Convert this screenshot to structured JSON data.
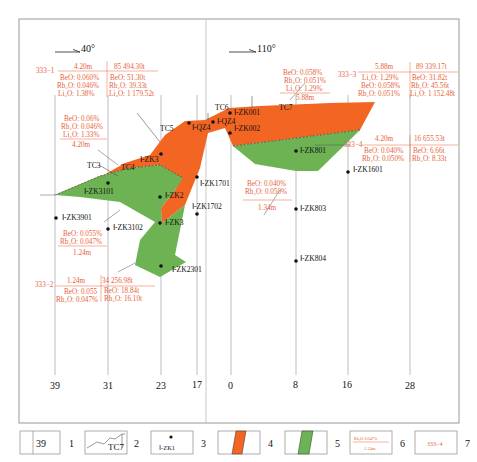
{
  "colors": {
    "orange_ore": "#f26522",
    "green_ore": "#6db253",
    "annotation": "#e8623a",
    "lines": "#aaaaaa",
    "text": "#111111"
  },
  "directions": {
    "left": "40°",
    "right": "110°"
  },
  "exploration_lines": [
    "39",
    "31",
    "23",
    "17",
    "0",
    "8",
    "16",
    "28"
  ],
  "trenches": [
    "TC3",
    "TC4",
    "TC5",
    "TC6",
    "TC7"
  ],
  "drillholes": [
    "Ⅰ-ZK001",
    "Ⅰ-QZ4",
    "Ⅰ-QZ4",
    "Ⅰ-ZK002",
    "Ⅰ-ZK3",
    "Ⅰ-ZK3101",
    "Ⅰ-ZK2",
    "Ⅰ-ZK1701",
    "Ⅰ-ZK1702",
    "Ⅰ-ZK3",
    "Ⅰ-ZK3901",
    "Ⅰ-ZK3102",
    "Ⅰ-ZK2301",
    "Ⅰ-ZK801",
    "Ⅰ-ZK1601",
    "Ⅰ-ZK803",
    "Ⅰ-ZK804"
  ],
  "blocks": {
    "b333_1": {
      "id": "333−1",
      "thickness": "4.20m",
      "tonnage": "85 494.30t",
      "grades": [
        "BeO: 0.060%",
        "Rb₂O: 0.046%",
        "Li₂O: 1.38%"
      ],
      "resources": [
        "BeO: 51.30t",
        "Rb₂O: 39.33t",
        "Li₂O: 1 179.52t"
      ]
    },
    "b333_2": {
      "id": "333−2",
      "thickness": "1.24m",
      "tonnage": "34 256.98t",
      "grades": [
        "BeO: 0.055",
        "Rb₂O: 0.047%"
      ],
      "resources": [
        "BeO: 18.84t",
        "Rb₂O: 16.10t"
      ]
    },
    "b333_3": {
      "id": "333−3",
      "thickness": "5.88m",
      "tonnage": "89 339.17t",
      "grades": [
        "Li₂O: 1.29%",
        "BeO: 0.058%",
        "Rb₂O: 0.051%"
      ],
      "resources": [
        "BeO: 31.82t",
        "Rb₂O: 45.56t",
        "Li₂O: 1 152.48t"
      ]
    },
    "b333_4": {
      "id": "333−4",
      "thickness": "4.20m",
      "tonnage": "16 655.53t",
      "grades": [
        "BeO: 0.040%",
        "Rb₂O: 0.050%"
      ],
      "resources": [
        "BeO: 6.66t",
        "Rb₂O: 8.33t"
      ]
    }
  },
  "body_annotations": {
    "orange_left": {
      "lines": [
        "BeO: 0.06%",
        "Rb₂O: 0.046%",
        "Li₂O: 1.33%"
      ],
      "thickness": "4.20m"
    },
    "orange_right": {
      "lines": [
        "BeO: 0.058%",
        "Rb₂O: 0.051%",
        "Li₂O: 1.29%"
      ],
      "thickness": "5.88m"
    },
    "green_left": {
      "lines": [
        "BeO: 0.055%",
        "Rb₂O: 0.047%"
      ],
      "thickness": "1.24m"
    },
    "green_right": {
      "lines": [
        "BeO: 0.040%",
        "Rb₂O: 0.050%"
      ],
      "thickness": "1.34m"
    }
  },
  "legend": [
    {
      "num": "1",
      "sample": "39"
    },
    {
      "num": "2",
      "sample": "TC7"
    },
    {
      "num": "3",
      "sample": "Ⅰ-ZK1"
    },
    {
      "num": "4",
      "sample": ""
    },
    {
      "num": "5",
      "sample": ""
    },
    {
      "num": "6",
      "sample_top": "Rb₂O 0.047%",
      "sample_bottom": "1.24m"
    },
    {
      "num": "7",
      "sample": "333−4"
    }
  ]
}
